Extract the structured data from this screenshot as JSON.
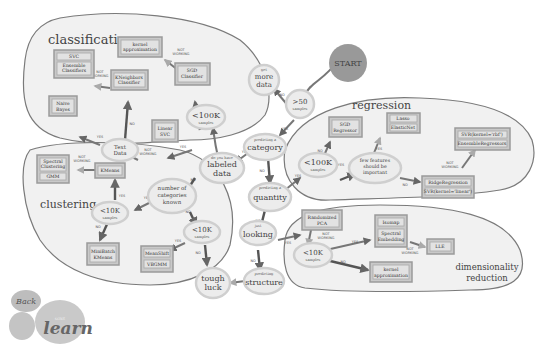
{
  "regions": {
    "classification": "classification",
    "regression": "regression",
    "clustering": "clustering",
    "dim1": "dimensionality",
    "dim2": "reduction"
  },
  "start": "START",
  "nodes": {
    "more_data": {
      "small": "get",
      "l1": "more",
      "l2": "data"
    },
    "gt50": {
      "big": ">50",
      "small": "samples"
    },
    "category": {
      "small": "predicting a",
      "big": "category"
    },
    "labeled": {
      "small": "do you have",
      "l1": "labeled",
      "l2": "data"
    },
    "quantity": {
      "small": "predicting a",
      "big": "quantity"
    },
    "looking": {
      "small": "just",
      "big": "looking"
    },
    "structure": {
      "small": "predicting",
      "big": "structure"
    },
    "tough": {
      "l1": "tough",
      "l2": "luck"
    },
    "cls_lt100k": {
      "big": "<100K",
      "small": "samples"
    },
    "text_data": {
      "l1": "Text",
      "l2": "Data"
    },
    "reg_lt100k": {
      "big": "<100K",
      "small": "samples"
    },
    "few_features": {
      "l1": "few features",
      "l2": "should be",
      "l3": "important"
    },
    "num_categories": {
      "l1": "number of",
      "l2": "categories",
      "l3": "known"
    },
    "clu_lt10k": {
      "big": "<10K",
      "small": "samples"
    },
    "clu_lt10k_b": {
      "big": "<10K",
      "small": "samples"
    },
    "dim_lt10k": {
      "big": "<10K",
      "small": "samples"
    }
  },
  "estimators": {
    "svc": "SVC",
    "ensemble_classifiers": [
      "Ensemble",
      "Classifiers"
    ],
    "kernel_approx_cls": [
      "kernel",
      "approximation"
    ],
    "kneighbors": [
      "KNeighbors",
      "Classifier"
    ],
    "sgd_classifier": [
      "SGD",
      "Classifier"
    ],
    "naive_bayes": [
      "Naive",
      "Bayes"
    ],
    "linear_svc": [
      "Linear",
      "SVC"
    ],
    "sgd_regressor": [
      "SGD",
      "Regressor"
    ],
    "lasso": "Lasso",
    "elasticnet": "ElasticNet",
    "svr_rbf": "SVR(kernel='rbf')",
    "ensemble_regressors": "EnsembleRegressors",
    "ridge": "RidgeRegression",
    "svr_linear": "SVR(kernel='linear')",
    "spectral_clustering": [
      "Spectral",
      "Clustering"
    ],
    "gmm": "GMM",
    "kmeans": "KMeans",
    "minibatch": [
      "MiniBatch",
      "KMeans"
    ],
    "meanshift": "MeanShift",
    "vbgmm": "VBGMM",
    "randomized_pca": [
      "Randomized",
      "PCA"
    ],
    "isomap": "Isomap",
    "spectral_embedding": [
      "Spectral",
      "Embedding"
    ],
    "lle": "LLE",
    "kernel_approx_dim": [
      "kernel",
      "approximation"
    ]
  },
  "edge_labels": {
    "yes": "YES",
    "no": "NO",
    "not_working1": "NOT",
    "not_working2": "WORKING"
  },
  "logo": {
    "back": "Back",
    "scikit": "scikit",
    "learn": "learn"
  }
}
